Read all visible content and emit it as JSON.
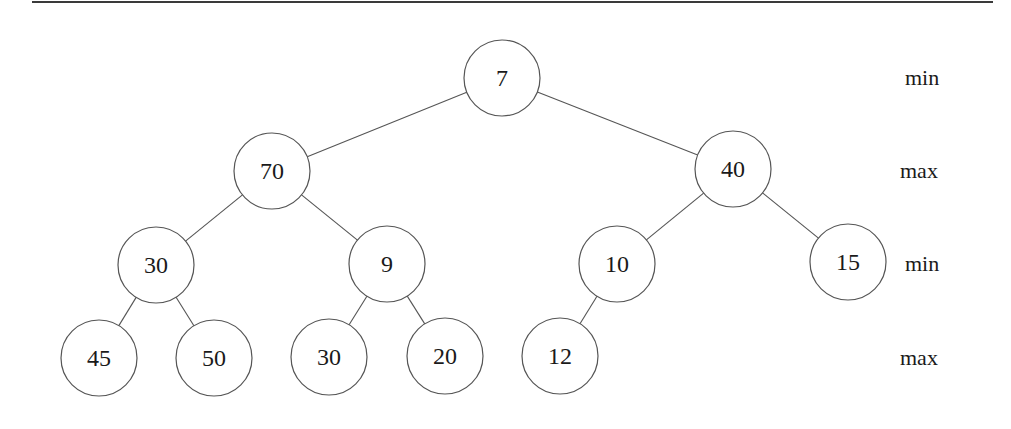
{
  "level_labels": [
    "min",
    "max",
    "min",
    "max"
  ],
  "nodes": [
    {
      "id": 0,
      "value": "7",
      "x": 502,
      "y": 78,
      "level": 0
    },
    {
      "id": 1,
      "value": "70",
      "x": 272,
      "y": 171,
      "level": 1
    },
    {
      "id": 2,
      "value": "40",
      "x": 733,
      "y": 169,
      "level": 1
    },
    {
      "id": 3,
      "value": "30",
      "x": 156,
      "y": 265,
      "level": 2
    },
    {
      "id": 4,
      "value": "9",
      "x": 387,
      "y": 264,
      "level": 2
    },
    {
      "id": 5,
      "value": "10",
      "x": 617,
      "y": 264,
      "level": 2
    },
    {
      "id": 6,
      "value": "15",
      "x": 848,
      "y": 262,
      "level": 2
    },
    {
      "id": 7,
      "value": "45",
      "x": 99,
      "y": 358,
      "level": 3
    },
    {
      "id": 8,
      "value": "50",
      "x": 214,
      "y": 358,
      "level": 3
    },
    {
      "id": 9,
      "value": "30",
      "x": 329,
      "y": 357,
      "level": 3
    },
    {
      "id": 10,
      "value": "20",
      "x": 445,
      "y": 356,
      "level": 3
    },
    {
      "id": 11,
      "value": "12",
      "x": 560,
      "y": 356,
      "level": 3
    }
  ],
  "edges": [
    [
      0,
      1
    ],
    [
      0,
      2
    ],
    [
      1,
      3
    ],
    [
      1,
      4
    ],
    [
      2,
      5
    ],
    [
      2,
      6
    ],
    [
      3,
      7
    ],
    [
      3,
      8
    ],
    [
      4,
      9
    ],
    [
      4,
      10
    ],
    [
      5,
      11
    ]
  ],
  "node_radius": 38,
  "level_label_positions": [
    {
      "x": 905,
      "y": 85
    },
    {
      "x": 900,
      "y": 178
    },
    {
      "x": 905,
      "y": 271
    },
    {
      "x": 900,
      "y": 365
    }
  ],
  "colors": {
    "stroke": "#555555",
    "text": "#1a1a1a",
    "rule": "#3a3a3a"
  }
}
